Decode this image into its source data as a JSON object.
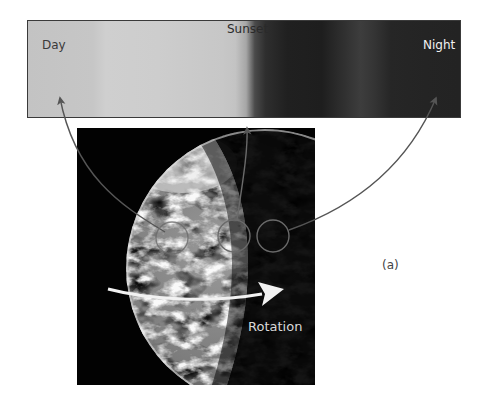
{
  "sky_bar": {
    "labels": {
      "day": "Day",
      "sunset": "Sunset",
      "night": "Night"
    },
    "colors": {
      "day": "#c4c4c4",
      "night": "#222222",
      "border": "#3a3a3a"
    }
  },
  "earth_photo": {
    "rotation_label": "Rotation",
    "markers": [
      {
        "name": "day-sample-circle",
        "points_to": "Day"
      },
      {
        "name": "sunset-sample-circle",
        "points_to": "Sunset"
      },
      {
        "name": "night-sample-circle",
        "points_to": "Night"
      }
    ]
  },
  "panel_label": "(a)",
  "colors": {
    "arrow": "#555555",
    "rotation_arrow": "#f0f0f0",
    "photo_background": "#020202"
  }
}
